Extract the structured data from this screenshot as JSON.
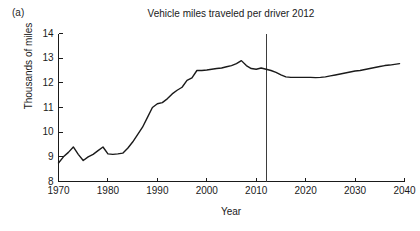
{
  "figure": {
    "panel_label": "(a)",
    "background_color": "#ffffff",
    "line_color": "#1a1a1a",
    "marker_line_color": "#3d3d3d"
  },
  "chart_data": {
    "type": "line",
    "title": "Vehicle miles traveled per driver 2012",
    "xlabel": "Year",
    "ylabel": "Thousands of miles",
    "xlim": [
      1970,
      2040
    ],
    "ylim": [
      8,
      14
    ],
    "grid": false,
    "legend": "none",
    "xticks": [
      1970,
      1980,
      1990,
      2000,
      2010,
      2020,
      2030,
      2040
    ],
    "yticks": [
      8,
      9,
      10,
      11,
      12,
      13,
      14
    ],
    "xtick_labels": [
      "1970",
      "1980",
      "1990",
      "2000",
      "2010",
      "2020",
      "2030",
      "2040"
    ],
    "ytick_labels": [
      "8",
      "9",
      "10",
      "11",
      "12",
      "13",
      "14"
    ],
    "annotations": [
      {
        "name": "present-year-divider",
        "type": "vline",
        "x": 2012,
        "label": ""
      }
    ],
    "series": [
      {
        "name": "Vehicle miles traveled per driver",
        "x": [
          1970,
          1971,
          1972,
          1973,
          1974,
          1975,
          1976,
          1977,
          1978,
          1979,
          1980,
          1981,
          1982,
          1983,
          1984,
          1985,
          1986,
          1987,
          1988,
          1989,
          1990,
          1991,
          1992,
          1993,
          1994,
          1995,
          1996,
          1997,
          1998,
          1999,
          2000,
          2001,
          2002,
          2003,
          2004,
          2005,
          2006,
          2007,
          2008,
          2009,
          2010,
          2011,
          2012,
          2013,
          2014,
          2015,
          2016,
          2017,
          2018,
          2019,
          2020,
          2021,
          2022,
          2023,
          2024,
          2025,
          2026,
          2027,
          2028,
          2029,
          2030,
          2031,
          2032,
          2033,
          2034,
          2035,
          2036,
          2037,
          2038,
          2039
        ],
        "y": [
          8.75,
          9.0,
          9.18,
          9.4,
          9.1,
          8.85,
          9.0,
          9.1,
          9.25,
          9.4,
          9.12,
          9.1,
          9.12,
          9.15,
          9.35,
          9.6,
          9.9,
          10.2,
          10.6,
          11.0,
          11.15,
          11.2,
          11.35,
          11.55,
          11.7,
          11.82,
          12.1,
          12.2,
          12.5,
          12.5,
          12.52,
          12.55,
          12.58,
          12.6,
          12.65,
          12.7,
          12.78,
          12.9,
          12.7,
          12.58,
          12.55,
          12.6,
          12.55,
          12.5,
          12.42,
          12.32,
          12.24,
          12.22,
          12.22,
          12.22,
          12.22,
          12.22,
          12.21,
          12.22,
          12.24,
          12.28,
          12.32,
          12.36,
          12.4,
          12.44,
          12.48,
          12.5,
          12.54,
          12.58,
          12.62,
          12.66,
          12.7,
          12.72,
          12.75,
          12.78
        ]
      }
    ]
  }
}
